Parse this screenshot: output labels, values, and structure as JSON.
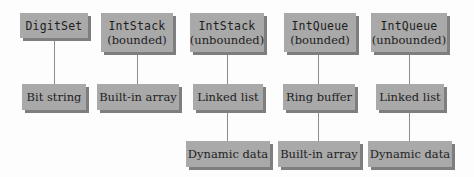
{
  "diagram": {
    "type": "implementation-hierarchy",
    "columns": [
      {
        "adt": {
          "name": "DigitSet",
          "qualifier": ""
        },
        "implementation": "Bit string",
        "underlying": ""
      },
      {
        "adt": {
          "name": "IntStack",
          "qualifier": "(bounded)"
        },
        "implementation": "Built-in array",
        "underlying": ""
      },
      {
        "adt": {
          "name": "IntStack",
          "qualifier": "(unbounded)"
        },
        "implementation": "Linked list",
        "underlying": "Dynamic data"
      },
      {
        "adt": {
          "name": "IntQueue",
          "qualifier": "(bounded)"
        },
        "implementation": "Ring buffer",
        "underlying": "Built-in array"
      },
      {
        "adt": {
          "name": "IntQueue",
          "qualifier": "(unbounded)"
        },
        "implementation": "Linked list",
        "underlying": "Dynamic data"
      }
    ],
    "colors": {
      "box_fill": "#a9a9a9",
      "box_shadow": "#7e7e7e",
      "connector": "#8c8c8c",
      "text": "#1e1e1e"
    }
  }
}
